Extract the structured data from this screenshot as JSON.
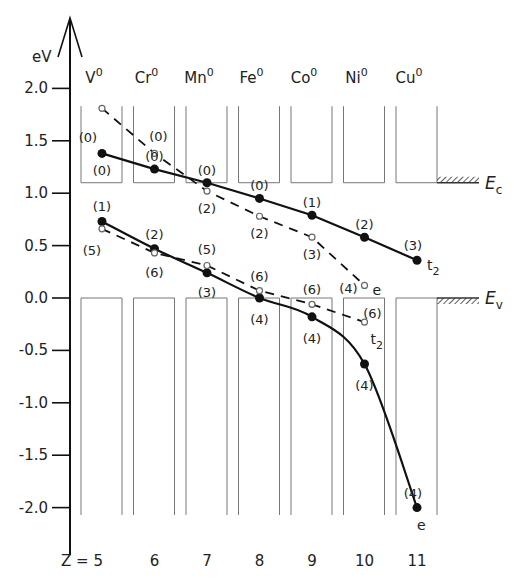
{
  "chart_data": {
    "type": "line",
    "title": "",
    "ylabel": "eV",
    "xlabel_prefix": "Z = ",
    "ylim": [
      -2.3,
      2.4
    ],
    "yticks": [
      "2.0",
      "1.5",
      "1.0",
      "0.5",
      "0.0",
      "-0.5",
      "-1.0",
      "-1.5",
      "-2.0"
    ],
    "ytick_values": [
      2.0,
      1.5,
      1.0,
      0.5,
      0.0,
      -0.5,
      -1.0,
      -1.5,
      -2.0
    ],
    "x": [
      5,
      6,
      7,
      8,
      9,
      10,
      11
    ],
    "xtick_labels": [
      "5",
      "6",
      "7",
      "8",
      "9",
      "10",
      "11"
    ],
    "elements": [
      {
        "symbol": "V",
        "sup": "0"
      },
      {
        "symbol": "Cr",
        "sup": "0"
      },
      {
        "symbol": "Mn",
        "sup": "0"
      },
      {
        "symbol": "Fe",
        "sup": "0"
      },
      {
        "symbol": "Co",
        "sup": "0"
      },
      {
        "symbol": "Ni",
        "sup": "0"
      },
      {
        "symbol": "Cu",
        "sup": "0"
      }
    ],
    "band_edges": {
      "Ec": 1.1,
      "Ev": 0.0,
      "Ec_label": "E",
      "Ec_sub": "c",
      "Ev_label": "E",
      "Ev_sub": "v"
    },
    "series": [
      {
        "name": "upper-t2",
        "style": "solid",
        "marker": "filled",
        "end_label": "t",
        "end_sub": "2",
        "x": [
          5,
          6,
          7,
          8,
          9,
          10,
          11
        ],
        "values": [
          1.38,
          1.23,
          1.1,
          0.95,
          0.79,
          0.58,
          0.36
        ],
        "labels": [
          "(0)",
          "(0)",
          "(0)",
          "(0)",
          "(1)",
          "(2)",
          "(3)"
        ]
      },
      {
        "name": "upper-e",
        "style": "dashed",
        "marker": "open",
        "end_label": "e",
        "end_sub": "",
        "x": [
          5,
          6,
          7,
          8,
          9,
          10
        ],
        "values": [
          1.81,
          1.38,
          1.02,
          0.78,
          0.58,
          0.12
        ],
        "labels": [
          "(0)",
          "(0)",
          "(2)",
          "(2)",
          "(3)",
          "(4)"
        ]
      },
      {
        "name": "lower-e",
        "style": "solid",
        "marker": "filled",
        "end_label": "e",
        "end_sub": "",
        "x": [
          5,
          6,
          7,
          8,
          9,
          10,
          11
        ],
        "values": [
          0.73,
          0.47,
          0.24,
          0.0,
          -0.18,
          -0.63,
          -2.0
        ],
        "labels": [
          "(1)",
          "(2)",
          "(3)",
          "(4)",
          "(4)",
          "(4)",
          "(4)"
        ]
      },
      {
        "name": "lower-t2",
        "style": "dashed",
        "marker": "open",
        "end_label": "t",
        "end_sub": "2",
        "x": [
          5,
          6,
          7,
          8,
          9,
          10
        ],
        "values": [
          0.66,
          0.43,
          0.31,
          0.07,
          -0.06,
          -0.23
        ],
        "labels": [
          "(5)",
          "(6)",
          "(5)",
          "(6)",
          "(6)",
          "(6)"
        ]
      }
    ]
  }
}
